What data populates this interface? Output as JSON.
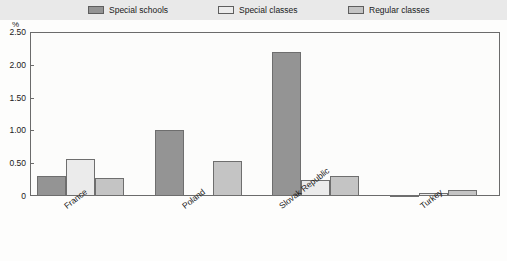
{
  "legend": {
    "items": [
      {
        "label": "Special schools",
        "color": "#949494",
        "icon": "legend-swatch-icon"
      },
      {
        "label": "Special classes",
        "color": "#ebebeb",
        "icon": "legend-swatch-icon"
      },
      {
        "label": "Regular classes",
        "color": "#c4c4c4",
        "icon": "legend-swatch-icon"
      }
    ]
  },
  "axis": {
    "y_unit": "%",
    "tick_labels": [
      "2.50",
      "2.00",
      "1.50",
      "1.00",
      "0.50",
      "0"
    ]
  },
  "footnote": {
    "text": ""
  },
  "chart_data": {
    "type": "bar",
    "title": "",
    "subtitle": "",
    "xlabel": "",
    "ylabel": "%",
    "ylim": [
      0,
      2.5
    ],
    "yticks": [
      0,
      0.5,
      1.0,
      1.5,
      2.0,
      2.5
    ],
    "grid": false,
    "legend_position": "top",
    "categories": [
      "France",
      "Poland",
      "Slovak Republic",
      "Turkey"
    ],
    "series": [
      {
        "name": "Special schools",
        "color": "#949494",
        "values": [
          0.31,
          1.0,
          2.2,
          0.02
        ]
      },
      {
        "name": "Special classes",
        "color": "#ebebeb",
        "values": [
          0.57,
          0.0,
          0.25,
          0.04
        ]
      },
      {
        "name": "Regular classes",
        "color": "#c4c4c4",
        "values": [
          0.27,
          0.53,
          0.3,
          0.09
        ]
      }
    ]
  }
}
